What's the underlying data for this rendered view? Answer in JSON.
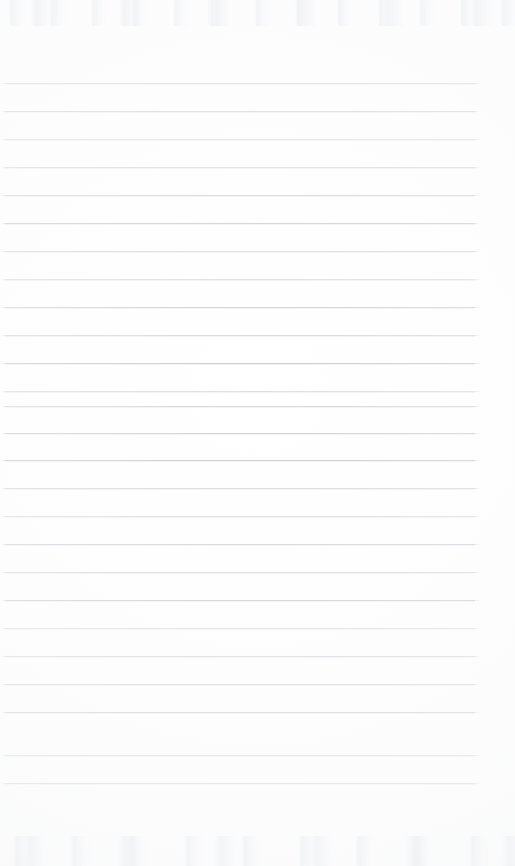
{
  "document": {
    "kind": "scanned-ruled-notebook-page",
    "title": "",
    "visible_text": "",
    "page_width": 515,
    "page_height": 866,
    "background_color": "#ffffff"
  },
  "ruling": {
    "line_count": 26,
    "first_line_y": 83,
    "line_spacing": 28,
    "line_start_x": 5,
    "line_end_x": 475,
    "line_thickness": 1,
    "line_color": "#d3d5d8",
    "has_left_margin_rule": false,
    "has_header_rule": false,
    "lines": [
      {
        "index": 1,
        "y": 83,
        "x1": 5,
        "x2": 475,
        "tone": "tone-b"
      },
      {
        "index": 2,
        "y": 111,
        "x1": 5,
        "x2": 475,
        "tone": "tone-a"
      },
      {
        "index": 3,
        "y": 139,
        "x1": 5,
        "x2": 475,
        "tone": "tone-d"
      },
      {
        "index": 4,
        "y": 167,
        "x1": 5,
        "x2": 475,
        "tone": "tone-b"
      },
      {
        "index": 5,
        "y": 195,
        "x1": 5,
        "x2": 475,
        "tone": "tone-a"
      },
      {
        "index": 6,
        "y": 223,
        "x1": 5,
        "x2": 475,
        "tone": "tone-c"
      },
      {
        "index": 7,
        "y": 251,
        "x1": 5,
        "x2": 475,
        "tone": "tone-b"
      },
      {
        "index": 8,
        "y": 279,
        "x1": 5,
        "x2": 475,
        "tone": "tone-d"
      },
      {
        "index": 9,
        "y": 307,
        "x1": 5,
        "x2": 475,
        "tone": "tone-a"
      },
      {
        "index": 10,
        "y": 335,
        "x1": 5,
        "x2": 475,
        "tone": "tone-b"
      },
      {
        "index": 11,
        "y": 363,
        "x1": 5,
        "x2": 475,
        "tone": "tone-c"
      },
      {
        "index": 12,
        "y": 391,
        "x1": 5,
        "x2": 475,
        "tone": "tone-d"
      },
      {
        "index": 13,
        "y": 406,
        "x1": 5,
        "x2": 475,
        "tone": "tone-b"
      },
      {
        "index": 14,
        "y": 433,
        "x1": 5,
        "x2": 475,
        "tone": "tone-a"
      },
      {
        "index": 15,
        "y": 460,
        "x1": 5,
        "x2": 475,
        "tone": "tone-c"
      },
      {
        "index": 16,
        "y": 488,
        "x1": 5,
        "x2": 475,
        "tone": "tone-b"
      },
      {
        "index": 17,
        "y": 516,
        "x1": 5,
        "x2": 475,
        "tone": "tone-d"
      },
      {
        "index": 18,
        "y": 544,
        "x1": 5,
        "x2": 475,
        "tone": "tone-a"
      },
      {
        "index": 19,
        "y": 572,
        "x1": 5,
        "x2": 475,
        "tone": "tone-b"
      },
      {
        "index": 20,
        "y": 600,
        "x1": 5,
        "x2": 475,
        "tone": "tone-c"
      },
      {
        "index": 21,
        "y": 628,
        "x1": 5,
        "x2": 475,
        "tone": "tone-d"
      },
      {
        "index": 22,
        "y": 656,
        "x1": 5,
        "x2": 475,
        "tone": "tone-b"
      },
      {
        "index": 23,
        "y": 684,
        "x1": 5,
        "x2": 475,
        "tone": "tone-a"
      },
      {
        "index": 24,
        "y": 712,
        "x1": 5,
        "x2": 475,
        "tone": "tone-c"
      },
      {
        "index": 25,
        "y": 755,
        "x1": 5,
        "x2": 475,
        "tone": "tone-b"
      },
      {
        "index": 26,
        "y": 783,
        "x1": 5,
        "x2": 475,
        "tone": "tone-a"
      }
    ]
  },
  "margins": {
    "top": 83,
    "bottom": 83,
    "left": 5,
    "right": 40
  },
  "scan_artifacts": {
    "top_band_height": 26,
    "bottom_band_height": 30,
    "noise_color": "#eef0f2"
  }
}
